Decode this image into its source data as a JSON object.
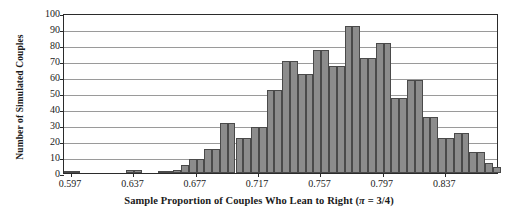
{
  "chart_data": {
    "type": "bar",
    "title": "",
    "xlabel": "Sample Proportion of Couples Who Lean to Right (π = 3/4)",
    "ylabel": "Number of Simulated Couples",
    "xlim": [
      0.5925,
      0.8715
    ],
    "ylim": [
      0,
      100
    ],
    "grid": true,
    "legend": false,
    "bin_width": 0.005,
    "xticks": [
      0.597,
      0.637,
      0.677,
      0.717,
      0.757,
      0.797,
      0.837
    ],
    "xtick_labels": [
      "0.597",
      "0.637",
      "0.677",
      "0.717",
      "0.757",
      "0.797",
      "0.837"
    ],
    "yticks": [
      0,
      10,
      20,
      30,
      40,
      50,
      60,
      70,
      80,
      90,
      100
    ],
    "ytick_labels": [
      "0",
      "10",
      "20",
      "30",
      "40",
      "50",
      "60",
      "70",
      "80",
      "90",
      "100"
    ],
    "categories": [
      "0.5925",
      "0.5975",
      "0.6025",
      "0.6075",
      "0.6125",
      "0.6175",
      "0.6225",
      "0.6275",
      "0.6325",
      "0.6375",
      "0.6425",
      "0.6475",
      "0.6525",
      "0.6575",
      "0.6625",
      "0.6675",
      "0.6725",
      "0.6775",
      "0.6825",
      "0.6875",
      "0.6925",
      "0.6975",
      "0.7025",
      "0.7075",
      "0.7125",
      "0.7175",
      "0.7225",
      "0.7275",
      "0.7325",
      "0.7375",
      "0.7425",
      "0.7475",
      "0.7525",
      "0.7575",
      "0.7625",
      "0.7675",
      "0.7725",
      "0.7775",
      "0.7825",
      "0.7875",
      "0.7925",
      "0.7975",
      "0.8025",
      "0.8075",
      "0.8125",
      "0.8175",
      "0.8225",
      "0.8275",
      "0.8325",
      "0.8375",
      "0.8425",
      "0.8475",
      "0.8525",
      "0.8575",
      "0.8625",
      "0.8675"
    ],
    "values": [
      1,
      1,
      0,
      0,
      0,
      0,
      0,
      0,
      2,
      2,
      0,
      0,
      1,
      1,
      2,
      5,
      9,
      9,
      15,
      15,
      31,
      31,
      22,
      22,
      29,
      29,
      52,
      52,
      70,
      70,
      62,
      62,
      77,
      77,
      67,
      67,
      92,
      92,
      72,
      72,
      81,
      81,
      47,
      47,
      58,
      58,
      35,
      35,
      22,
      22,
      25,
      25,
      13,
      13,
      6,
      4
    ],
    "colors": {
      "bar_fill": "#8c8c8c",
      "bar_edge": "#4a4a4a",
      "grid": "#9a9a9a",
      "frame": "#2b2b2b",
      "text": "#1a1a1a"
    }
  }
}
